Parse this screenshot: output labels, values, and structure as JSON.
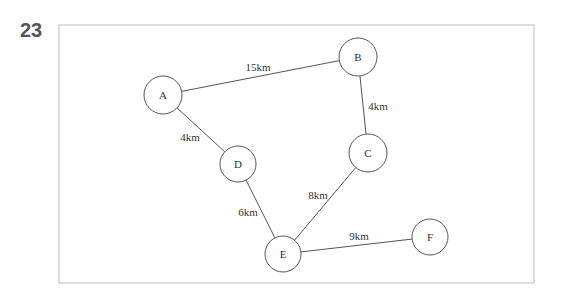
{
  "question": {
    "number": "23"
  },
  "frame": {
    "x": 59,
    "y": 25,
    "width": 475,
    "height": 258,
    "stroke": "#c8c8c8"
  },
  "colors": {
    "stroke": "#555555",
    "text": "#333333",
    "number": "#555555"
  },
  "nodes": [
    {
      "id": "A",
      "label": "A",
      "x": 163,
      "y": 95,
      "r": 19
    },
    {
      "id": "B",
      "label": "B",
      "x": 358,
      "y": 57,
      "r": 19
    },
    {
      "id": "C",
      "label": "C",
      "x": 368,
      "y": 153,
      "r": 19
    },
    {
      "id": "D",
      "label": "D",
      "x": 238,
      "y": 164,
      "r": 18
    },
    {
      "id": "E",
      "label": "E",
      "x": 283,
      "y": 254,
      "r": 18
    },
    {
      "id": "F",
      "label": "F",
      "x": 430,
      "y": 237,
      "r": 18
    }
  ],
  "edges": [
    {
      "from": "A",
      "to": "B",
      "label": "15km",
      "label_x": 258,
      "label_y": 67
    },
    {
      "from": "A",
      "to": "D",
      "label": "4km",
      "label_x": 190,
      "label_y": 137
    },
    {
      "from": "B",
      "to": "C",
      "label": "4km",
      "label_x": 378,
      "label_y": 106
    },
    {
      "from": "C",
      "to": "E",
      "label": "8km",
      "label_x": 318,
      "label_y": 195
    },
    {
      "from": "D",
      "to": "E",
      "label": "6km",
      "label_x": 248,
      "label_y": 212
    },
    {
      "from": "E",
      "to": "F",
      "label": "9km",
      "label_x": 359,
      "label_y": 236
    }
  ]
}
